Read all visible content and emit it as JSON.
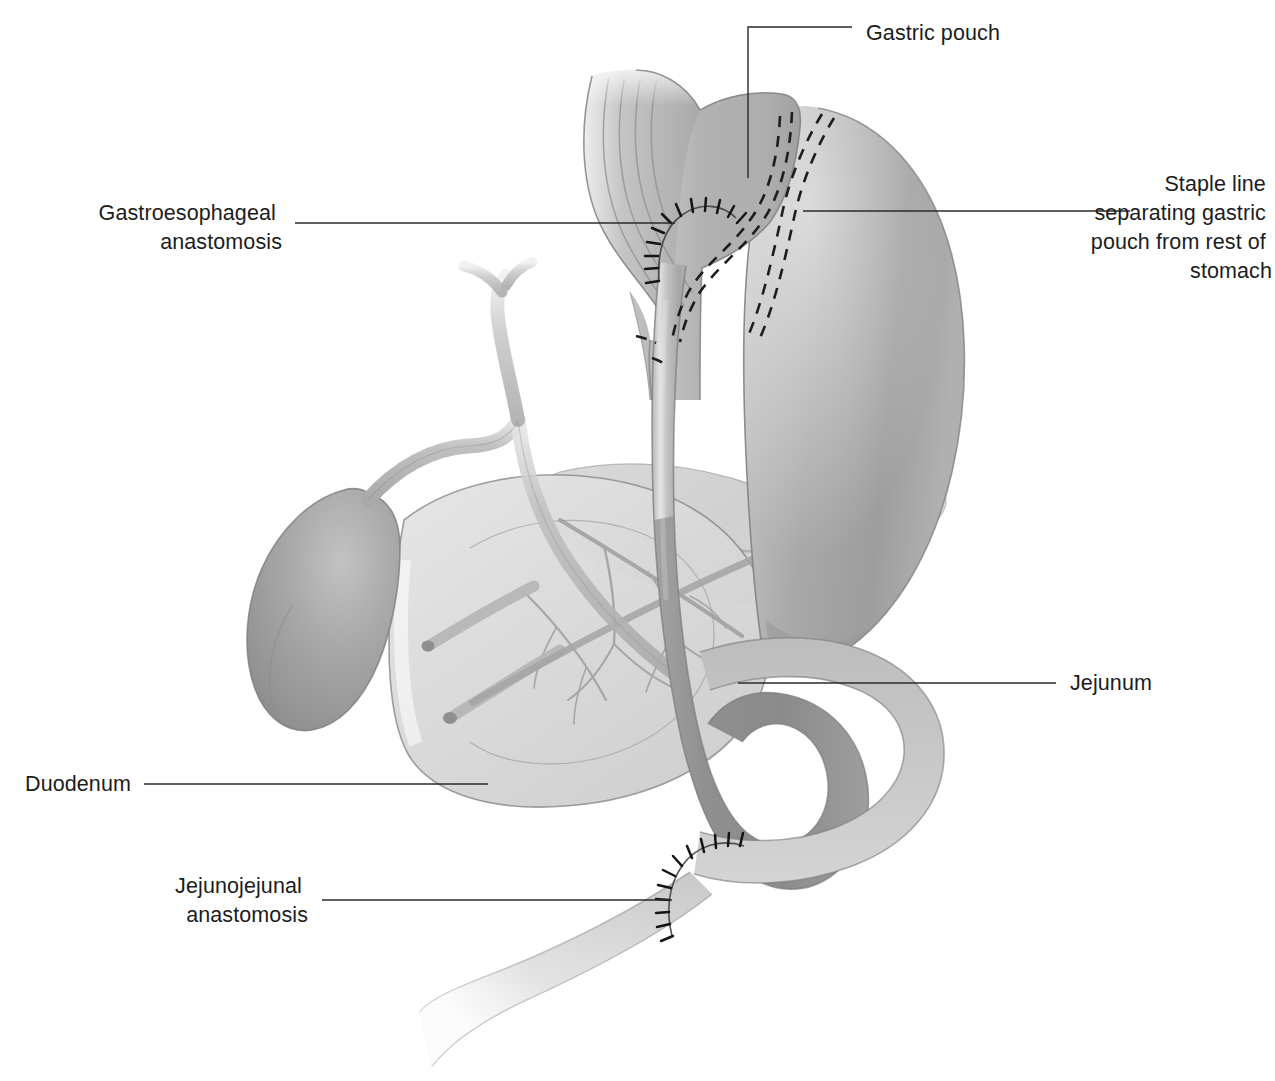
{
  "figure": {
    "background_color": "#ffffff",
    "line_color": "#2a2a2a",
    "text_color": "#1c1c1c"
  },
  "labels": [
    {
      "id": "gastric-pouch",
      "text": "Gastric pouch",
      "lines": [
        "Gastric pouch"
      ],
      "align": "left",
      "text_x": 866,
      "text_y": 40,
      "leader": "M 748,178 L 748,27 L 852,27"
    },
    {
      "id": "staple-line",
      "text": "Staple line separating gastric pouch from rest of stomach",
      "lines": [
        "Staple line",
        "separating gastric",
        "pouch from rest of",
        "stomach"
      ],
      "align": "right",
      "text_x": 1272,
      "text_y": 191,
      "leader": "M 803,211 L 1130,211"
    },
    {
      "id": "gastroesophageal-anastomosis",
      "text": "Gastroesophageal anastomosis",
      "lines": [
        "Gastroesophageal",
        "anastomosis"
      ],
      "align": "right",
      "text_x": 282,
      "text_y": 220,
      "leader": "M 675,223 L 295,223"
    },
    {
      "id": "jejunum",
      "text": "Jejunum",
      "lines": [
        "Jejunum"
      ],
      "align": "left",
      "text_x": 1070,
      "text_y": 690,
      "leader": "M 738,683 L 1056,683"
    },
    {
      "id": "duodenum",
      "text": "Duodenum",
      "lines": [
        "Duodenum"
      ],
      "align": "right",
      "text_x": 131,
      "text_y": 791,
      "leader": "M 488,784 L 144,784"
    },
    {
      "id": "jejunojejunal-anastomosis",
      "text": "Jejunojejunal anastomosis",
      "lines": [
        "Jejunojejunal",
        "anastomosis"
      ],
      "align": "right",
      "text_x": 308,
      "text_y": 893,
      "leader": "M 672,900 L 322,900"
    }
  ],
  "structures": [
    {
      "id": "esophagus",
      "name": "Esophagus",
      "fill": "#b6b6b6"
    },
    {
      "id": "gastric-pouch",
      "name": "Gastric pouch",
      "fill": "#b9b9b9"
    },
    {
      "id": "remnant-stomach",
      "name": "Remnant stomach",
      "fill": "#adadad"
    },
    {
      "id": "duodenum",
      "name": "Duodenum",
      "fill": "#d9d9d9"
    },
    {
      "id": "pancreas",
      "name": "Pancreas",
      "fill": "#cfcfcf"
    },
    {
      "id": "gallbladder",
      "name": "Gallbladder",
      "fill": "#a6a6a6"
    },
    {
      "id": "bile-duct",
      "name": "Common bile duct",
      "fill": "#b4b4b4"
    },
    {
      "id": "roux-limb",
      "name": "Roux limb (jejunum)",
      "fill": "#989898"
    },
    {
      "id": "biliopancreatic-limb",
      "name": "Biliopancreatic limb",
      "fill": "#bdbdbd"
    },
    {
      "id": "efferent-limb",
      "name": "Efferent jejunal limb",
      "fill": "#c9c9c9"
    },
    {
      "id": "gastroesophageal-anastomosis",
      "name": "Gastroesophageal anastomosis suture line",
      "fill": "#141414"
    },
    {
      "id": "jejunojejunal-anastomosis",
      "name": "Jejunojejunal anastomosis suture line",
      "fill": "#141414"
    },
    {
      "id": "staple-line",
      "name": "Staple line",
      "fill": "#1d1d1d"
    }
  ]
}
